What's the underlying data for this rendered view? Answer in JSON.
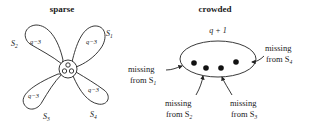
{
  "sparse": {
    "title": "sparse",
    "petals": [
      {
        "set": "S",
        "index": "1",
        "label": "q−3"
      },
      {
        "set": "S",
        "index": "2",
        "label": "q−3"
      },
      {
        "set": "S",
        "index": "3",
        "label": "q−3"
      },
      {
        "set": "S",
        "index": "4",
        "label": "q−3"
      }
    ],
    "core_points": 3
  },
  "crowded": {
    "title": "crowded",
    "ellipse_label": "q + 1",
    "dots": 4,
    "annotations": [
      {
        "line1": "missing",
        "line2": "from S",
        "index": "1"
      },
      {
        "line1": "missing",
        "line2": "from S",
        "index": "2"
      },
      {
        "line1": "missing",
        "line2": "from S",
        "index": "3"
      },
      {
        "line1": "missing",
        "line2": "from S",
        "index": "4"
      }
    ]
  }
}
